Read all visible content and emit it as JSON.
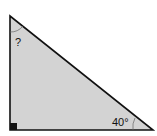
{
  "diagram": {
    "shape": "right-triangle",
    "fill_color": "#d3d3d3",
    "stroke_color": "#111111",
    "unknown_angle_label": "?",
    "known_angle_label": "40°",
    "right_angle_marker": "filled-square"
  }
}
